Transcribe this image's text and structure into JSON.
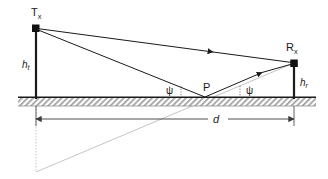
{
  "figure": {
    "type": "two-ray-ground-reflection-propagation-diagram",
    "background_color": "#ffffff",
    "stroke_color": "#1a1a1a",
    "faint_color": "#b8b8b8",
    "ground_fill": "#c9c9c9"
  },
  "labels": {
    "tx": {
      "base": "T",
      "sub": "x"
    },
    "rx": {
      "base": "R",
      "sub": "x"
    },
    "h_t": {
      "base": "h",
      "sub": "t"
    },
    "h_r": {
      "base": "h",
      "sub": "r"
    },
    "psi_left": "ψ",
    "psi_right": "ψ",
    "reflection_point": "P",
    "distance": "d"
  },
  "geometry": {
    "tx_node": {
      "x": 36,
      "y": 28
    },
    "rx_node": {
      "x": 294,
      "y": 63
    },
    "reflection_point": {
      "x": 205,
      "y": 97
    },
    "ground_line_y": 97,
    "ground_band_bottom": 106,
    "ground_x_start": 18,
    "ground_x_end": 316,
    "image_point": {
      "x": 36,
      "y": 172
    },
    "dimension_line_y": 119,
    "dimension_x_start": 36,
    "dimension_x_end": 294,
    "mast_width": 2.2
  },
  "elements": {
    "direct_path": "line-of-sight ray from Tx to Rx with mid arrowhead",
    "incident_path": "ray from Tx down to reflection point P",
    "reflected_path": "ray from P up to Rx with mid arrowhead",
    "image_ray": "faint gray ray from image point below ground up through P to Rx",
    "image_mast": "faint gray dotted vertical line from ground down to image point",
    "angle_ticks": "dotted vertical tick marks marking grazing angles psi"
  }
}
